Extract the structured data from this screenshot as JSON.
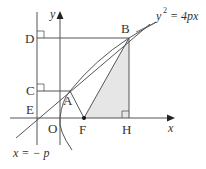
{
  "diagram": {
    "type": "parabola-geometry",
    "labels": {
      "y_axis": "y",
      "x_axis": "x",
      "origin": "O",
      "point_A": "A",
      "point_B": "B",
      "point_C": "C",
      "point_D": "D",
      "point_E": "E",
      "point_F": "F",
      "point_H": "H",
      "parabola_eq_lhs": "y",
      "parabola_eq_exp": "2",
      "parabola_eq_rhs": "= 4px",
      "directrix": "x = − p"
    },
    "colors": {
      "line": "#555555",
      "shade": "#e6e6e6",
      "text": "#333333"
    }
  }
}
